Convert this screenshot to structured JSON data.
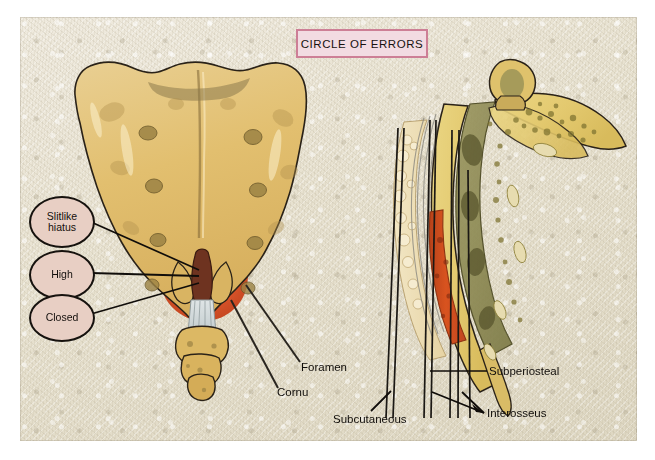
{
  "plate": {
    "title": "CIRCLE OF ERRORS",
    "title_border_color": "#cd7f96",
    "title_fill_color": "#f2dbe2",
    "background_color": "#e9e4d4"
  },
  "callouts": [
    {
      "id": "slitlike",
      "line1": "Slitlike",
      "line2": "hiatus"
    },
    {
      "id": "high",
      "line1": "High",
      "line2": ""
    },
    {
      "id": "closed",
      "line1": "Closed",
      "line2": ""
    }
  ],
  "labels": {
    "foramen": "Foramen",
    "cornu": "Cornu",
    "subperiosteal": "Subperiosteal",
    "subcutaneous": "Subcutaneous",
    "interosseus": "Interosseus"
  },
  "figures": {
    "left": {
      "name": "posterior-sacrum-view",
      "bone_color": "#e3c178",
      "bone_shadow_color": "#c5a053",
      "hiatus_circle_color": "#d94f24",
      "ligament_color": "#c9d2d4",
      "outline_color": "#272018"
    },
    "right": {
      "name": "sagittal-sacrum-section",
      "cortical_color": "#e8d27a",
      "marrow_color": "#8d8a52",
      "canal_color": "#cf4a1e",
      "fat_color": "#eddfb5",
      "outline_color": "#272018"
    }
  }
}
